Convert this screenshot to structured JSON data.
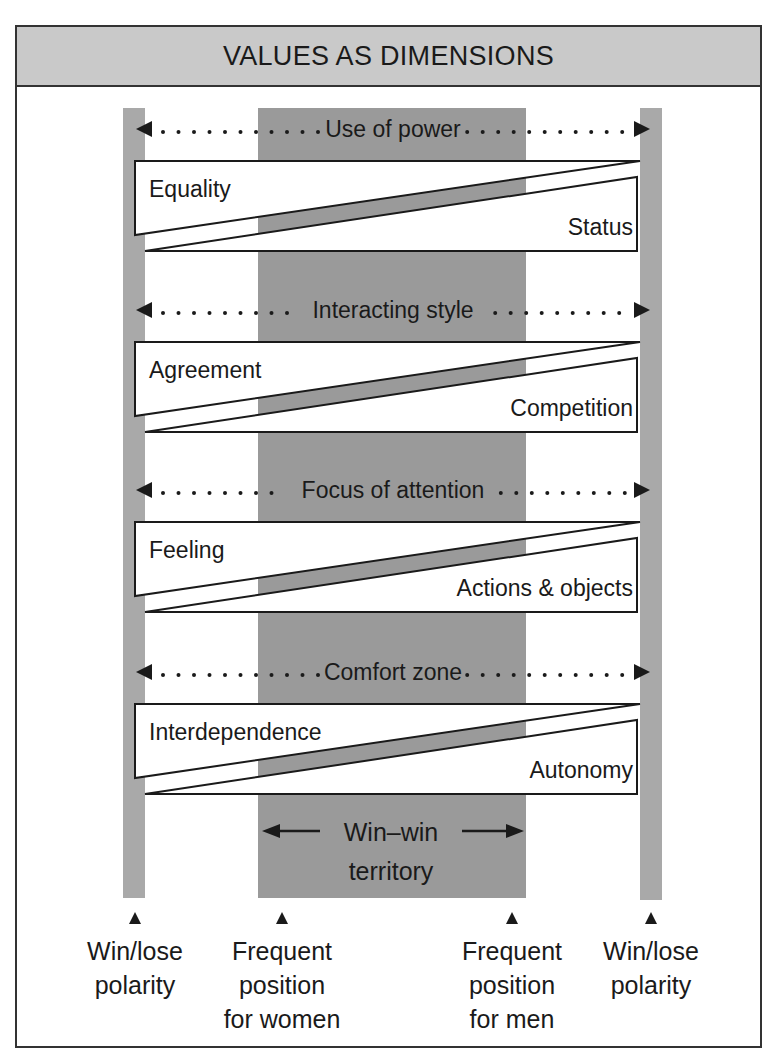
{
  "title": "VALUES AS DIMENSIONS",
  "colors": {
    "title_bg": "#c9c9c9",
    "polarity_bar": "#a9a9a9",
    "win_win_zone": "#9a9a9a",
    "border": "#333333"
  },
  "dimensions": [
    {
      "name": "Use of power",
      "left_value": "Equality",
      "right_value": "Status"
    },
    {
      "name": "Interacting style",
      "left_value": "Agreement",
      "right_value": "Competition"
    },
    {
      "name": "Focus of attention",
      "left_value": "Feeling",
      "right_value": "Actions & objects"
    },
    {
      "name": "Comfort zone",
      "left_value": "Interdependence",
      "right_value": "Autonomy"
    }
  ],
  "win_win": {
    "line1": "Win–win",
    "line2": "territory"
  },
  "bottom_labels": [
    {
      "line1": "Win/lose",
      "line2": "polarity",
      "line3": ""
    },
    {
      "line1": "Frequent",
      "line2": "position",
      "line3": "for women"
    },
    {
      "line1": "Frequent",
      "line2": "position",
      "line3": "for men"
    },
    {
      "line1": "Win/lose",
      "line2": "polarity",
      "line3": ""
    }
  ]
}
